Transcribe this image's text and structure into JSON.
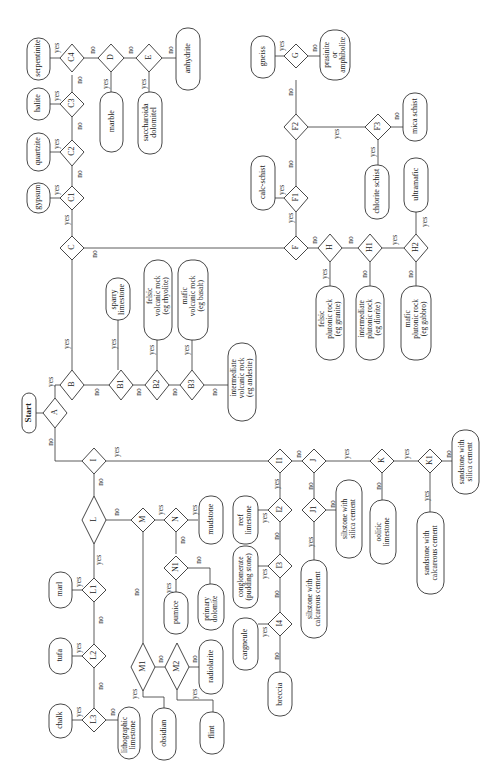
{
  "diagram": {
    "type": "flowchart",
    "orientation": "rotated-90-ccw",
    "start": "Start",
    "decisions": [
      "A",
      "B",
      "B1",
      "B2",
      "B3",
      "C",
      "C1",
      "C2",
      "C3",
      "C4",
      "D",
      "E",
      "F",
      "F1",
      "F2",
      "F3",
      "G",
      "H",
      "H1",
      "H2",
      "I",
      "I1",
      "I2",
      "I3",
      "I4",
      "J",
      "J1",
      "K",
      "K1",
      "L",
      "L1",
      "L2",
      "L3",
      "M",
      "M1",
      "M2",
      "N",
      "N1"
    ],
    "outcomes": {
      "gypsum": "gypsum",
      "quartzite": "quartzite",
      "halite": "halite",
      "serpentinite": "serpentinite",
      "marble": "marble",
      "saccharoidal_dolomite": "saccharoida\ndolomitel",
      "anhydrite": "anhydrite",
      "sparry_limestone": "sparry\nlimestone",
      "felsic_volcanic": "felsic\nvolcanic rock\n(eg rhyolite)",
      "mafic_volcanic": "mafic\nvolcanic rock\n(eg basalt)",
      "intermediate_volcanic": "intermediate\nvolcanic rock\n(eg andesite)",
      "gneiss": "gneiss",
      "prasinite": "prasinite\nor\namphibolite",
      "calc_schist": "calc-schist",
      "chlorite_schist": "chlorite schist",
      "mica_schist": "mica schist",
      "ultramafic": "ultramafic",
      "felsic_plutonic": "felsic\nplutonic rock\n(eg granite)",
      "intermediate_plutonic": "intermediate\nplutonic rock\n(eg diorite)",
      "mafic_plutonic": "mafic\nplutonic rock\n(eg gabbro)",
      "marl": "marl",
      "tufa": "tufa",
      "chalk": "chalk",
      "lithographic_limestone": "lithographic\nlimestone",
      "obsidian": "obsidian",
      "flint": "flint",
      "radiolarite": "radiolarite",
      "mudstone": "mudstone",
      "pumice": "pumice",
      "primary_dolomite": "primary\ndolomite",
      "reef_limestone": "reef\nlimestone",
      "conglomerate": "conglomerate\n(pudding stone)",
      "cargneule": "cargneule",
      "breccia": "breccia",
      "siltstone_calc": "siltstone with\ncalcareous cement",
      "siltstone_silica": "siltstone with\nsilica cement",
      "oolitic_limestone": "oolitic\nlimestone",
      "sandstone_calc": "sandstone with\ncalcareous cement",
      "sandstone_silica": "sandstone with\nsilica cement"
    },
    "edge_labels": {
      "yes": "yes",
      "no": "no"
    }
  }
}
